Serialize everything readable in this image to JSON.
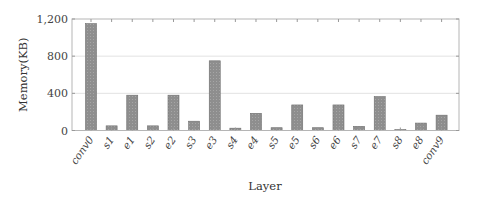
{
  "chart_data": {
    "type": "bar",
    "title": "",
    "xlabel": "Layer",
    "ylabel": "Memory(KB)",
    "ylim": [
      0,
      1200
    ],
    "yticks": [
      0,
      400,
      800,
      1200
    ],
    "ytick_labels": [
      "0",
      "400",
      "800",
      "1,200"
    ],
    "grid": "horizontal",
    "legend": null,
    "categories": [
      "conv0",
      "s1",
      "e1",
      "s2",
      "e2",
      "s3",
      "e3",
      "s4",
      "e4",
      "s5",
      "e5",
      "s6",
      "e6",
      "s7",
      "e7",
      "s8",
      "e8",
      "conv9"
    ],
    "values": [
      1150,
      50,
      380,
      50,
      380,
      100,
      750,
      25,
      185,
      30,
      275,
      30,
      275,
      45,
      365,
      10,
      80,
      165
    ],
    "bar_color": "#8c8c8c"
  }
}
